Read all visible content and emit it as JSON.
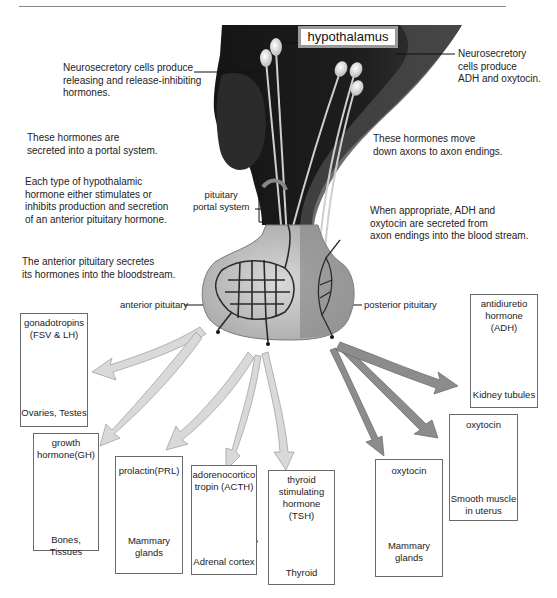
{
  "diagram": {
    "title_label": "hypothalamus",
    "annotations": {
      "neurosecretory_left": [
        "Neurosecretory cells produce",
        "releasing and release-inhibiting",
        "hormones."
      ],
      "neurosecretory_right": [
        "Neurosecretory",
        "cells produce",
        "ADH and oxytocin."
      ],
      "portal_secretion": [
        "These hormones are",
        "secreted into a portal system."
      ],
      "hypothalamic_effect": [
        "Each type of hypothalamic",
        "hormone either stimulates or",
        "inhibits production and secretion",
        "of an anterior pituitary hormone."
      ],
      "anterior_secretes": [
        "The anterior pituitary secretes",
        "its hormones into the bloodstream."
      ],
      "axon_movement": [
        "These hormones move",
        "down axons to axon endings."
      ],
      "posterior_release": [
        "When appropriate, ADH and",
        "oxytocin are secreted from",
        "axon endings into the blood stream."
      ]
    },
    "structure_labels": {
      "portal_system": [
        "pituitary",
        "portal system"
      ],
      "anterior_pituitary": "anterior pituitary",
      "posterior_pituitary": "posterior pituitary"
    },
    "target_boxes": [
      {
        "id": "gonadotropins",
        "hormone": [
          "gonadotropins",
          "(FSV & LH)"
        ],
        "target": [
          "Ovaries, Testes"
        ],
        "icon": "ovary-testis-icon",
        "source": "anterior"
      },
      {
        "id": "growth",
        "hormone": [
          "growth",
          "hormone(GH)"
        ],
        "target": [
          "Bones, Tissues"
        ],
        "icon": "bone-muscle-icon",
        "source": "anterior"
      },
      {
        "id": "prolactin",
        "hormone": [
          "prolactin(PRL)"
        ],
        "target": [
          "Mammary",
          "glands"
        ],
        "icon": "mammary-gland-icon",
        "source": "anterior"
      },
      {
        "id": "acth",
        "hormone": [
          "adorenocortico",
          "tropin (ACTH)"
        ],
        "target": [
          "Adrenal cortex"
        ],
        "icon": "adrenal-cortex-icon",
        "source": "anterior"
      },
      {
        "id": "tsh",
        "hormone": [
          "thyroid",
          "stimulating",
          "hormone (TSH)"
        ],
        "target": [
          "Thyroid"
        ],
        "icon": "thyroid-icon",
        "source": "anterior"
      },
      {
        "id": "oxytocin_mammary",
        "hormone": [
          "oxytocin"
        ],
        "target": [
          "Mammary",
          "glands"
        ],
        "icon": "mammary-gland-icon",
        "source": "posterior"
      },
      {
        "id": "oxytocin_uterus",
        "hormone": [
          "oxytocin"
        ],
        "target": [
          "Smooth muscle",
          "in uterus"
        ],
        "icon": "uterus-icon",
        "source": "posterior"
      },
      {
        "id": "adh",
        "hormone": [
          "antidiuretio",
          "hormone (ADH)"
        ],
        "target": [
          "Kidney tubules"
        ],
        "icon": "kidney-icon",
        "source": "posterior"
      }
    ],
    "colors": {
      "brain": "#1f1f1f",
      "brain_mid": "#3a3a3a",
      "anterior_arrow": "#d8d8d8",
      "posterior_arrow": "#8c8c8c",
      "box_border": "#6a6a6a"
    }
  }
}
